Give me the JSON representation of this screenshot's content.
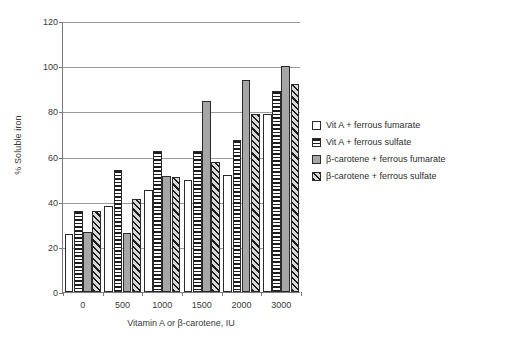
{
  "chart_data": {
    "type": "bar",
    "title": "",
    "xlabel": "Vitamin A or β-carotene, IU",
    "ylabel": "% Soluble iron",
    "categories": [
      "0",
      "500",
      "1000",
      "1500",
      "2000",
      "3000"
    ],
    "ylim": [
      0,
      120
    ],
    "ytick_values": [
      0,
      20,
      40,
      60,
      80,
      100,
      120
    ],
    "ytick_labels": [
      "0",
      "20",
      "40",
      "60",
      "80",
      "100",
      "120"
    ],
    "grid": "horizontal",
    "legend_position": "right",
    "series": [
      {
        "name": "Vit A + ferrous fumarate",
        "pattern": "plain-white",
        "values": [
          25.5,
          38,
          45,
          49.5,
          52,
          79
        ]
      },
      {
        "name": "Vit A + ferrous sulfate",
        "pattern": "horizontal-stripes",
        "values": [
          36,
          54,
          62.5,
          62.5,
          67.5,
          89
        ]
      },
      {
        "name": "β-carotene + ferrous fumarate",
        "pattern": "solid-grey",
        "values": [
          26.5,
          26,
          51.5,
          84.5,
          94,
          100
        ]
      },
      {
        "name": "β-carotene + ferrous sulfate",
        "pattern": "diagonal-hatch",
        "values": [
          36,
          41,
          51,
          57.5,
          79,
          92
        ]
      }
    ]
  },
  "legend": {
    "items": [
      {
        "label": "Vit A + ferrous fumarate",
        "swatch": "plain-white"
      },
      {
        "label": "Vit A + ferrous sulfate",
        "swatch": "horizontal-stripes"
      },
      {
        "label": "β-carotene + ferrous fumarate",
        "swatch": "solid-grey"
      },
      {
        "label": "β-carotene + ferrous sulfate",
        "swatch": "diagonal-hatch"
      }
    ]
  },
  "caption": {
    "sliver_text": ""
  }
}
